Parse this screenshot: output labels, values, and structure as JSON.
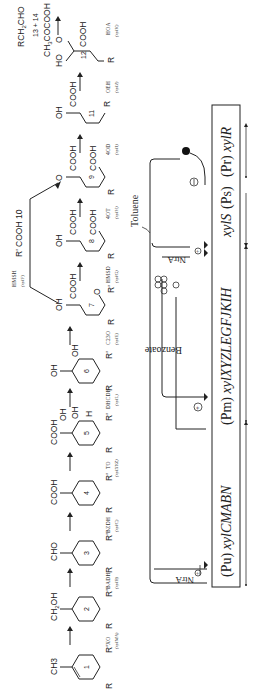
{
  "figure": {
    "orientation": "rotated 90 degrees counter-clockwise",
    "pathway": {
      "compounds": [
        {
          "id": "1",
          "substituent": "CH3",
          "groups": [
            "R",
            "R'"
          ]
        },
        {
          "id": "2",
          "substituent": "CH2OH",
          "groups": [
            "R",
            "R'"
          ]
        },
        {
          "id": "3",
          "substituent": "CHO",
          "groups": [
            "R",
            "R'"
          ]
        },
        {
          "id": "4",
          "substituent": "COOH",
          "groups": [
            "R",
            "R'"
          ]
        },
        {
          "id": "5",
          "substituent": "COOH",
          "groups": [
            "OH",
            "OH",
            "H",
            "R",
            "R'"
          ]
        },
        {
          "id": "6",
          "substituent": "OH",
          "groups": [
            "OH",
            "R",
            "R'"
          ]
        },
        {
          "id": "7",
          "substituent": "OH",
          "groups": [
            "COOH",
            "O",
            "R",
            "R'"
          ]
        },
        {
          "id": "8",
          "substituent": "OH",
          "groups": [
            "COOH",
            "COOH",
            "R"
          ]
        },
        {
          "id": "9",
          "substituent": "O",
          "groups": [
            "COOH",
            "COOH",
            "R"
          ]
        },
        {
          "id": "10",
          "label": "R' COOH 10"
        },
        {
          "id": "11",
          "substituent": "OH",
          "groups": [
            "COOH",
            "R"
          ]
        },
        {
          "id": "12",
          "substituent": "O",
          "groups": [
            "HO",
            "COOH",
            "R"
          ]
        },
        {
          "id": "13 + 14",
          "products": [
            "RCH2CHO",
            "CH3COCOOH"
          ]
        }
      ],
      "enzymes": [
        {
          "abbr": "XO",
          "gene": "(xylMA)"
        },
        {
          "abbr": "BADH",
          "gene": "(xylB)"
        },
        {
          "abbr": "BZDH",
          "gene": "(xylC)"
        },
        {
          "abbr": "TO",
          "gene": "(xylXYZ)"
        },
        {
          "abbr": "DHCDH",
          "gene": "(xylL)"
        },
        {
          "abbr": "C23O",
          "gene": "(xylE)"
        },
        {
          "abbr": "HMSD",
          "gene": "(xylG)"
        },
        {
          "abbr": "4OT",
          "gene": "(xylH)"
        },
        {
          "abbr": "4OD",
          "gene": "(xylI)"
        },
        {
          "abbr": "OEH",
          "gene": "(xylJ)"
        },
        {
          "abbr": "HOA",
          "gene": "(xylK)"
        },
        {
          "abbr": "HMSH",
          "gene": "(xylF)"
        }
      ]
    },
    "regulation": {
      "operon_segments": [
        {
          "promoter": "(Pu)",
          "genes": "xylCMABN"
        },
        {
          "promoter": "(Pm)",
          "genes": "xylXYZLEGFJKIH"
        },
        {
          "genes": "xylS"
        },
        {
          "promoter": "(Ps)"
        },
        {
          "promoter": "(Pr)",
          "genes": "xylR"
        }
      ],
      "effectors": [
        "Toluene",
        "Benzoate"
      ],
      "activator": "NtrA",
      "activator_2": "NtrA",
      "signs": {
        "plus": "⊕",
        "minus": "⊖"
      }
    }
  }
}
